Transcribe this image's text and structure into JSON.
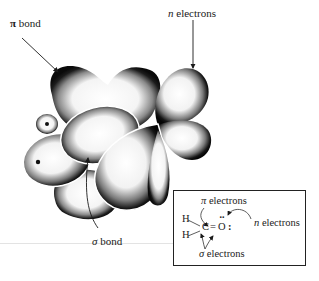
{
  "diagram": {
    "labels": {
      "pi_bond": {
        "symbol": "π",
        "text": " bond"
      },
      "n_electrons": {
        "symbol": "n",
        "text": " electrons"
      },
      "sigma_bond": {
        "symbol": "σ",
        "text": " bond"
      }
    },
    "inset": {
      "pi_electrons": {
        "symbol": "π",
        "text": " electrons"
      },
      "n_electrons": {
        "symbol": "n",
        "text": " electrons"
      },
      "sigma_electrons": {
        "symbol": "σ",
        "text": " electrons"
      },
      "formula": {
        "h_top": "H",
        "h_bottom": "H",
        "carbon": "C",
        "double_bond": "=",
        "oxygen": "O",
        "lone_pair": ":",
        "top_dots": "··"
      }
    },
    "colors": {
      "ink": "#1a1a1a",
      "background": "#ffffff",
      "orbital_fill": "#ffffff",
      "orbital_shade": "#111111"
    }
  }
}
